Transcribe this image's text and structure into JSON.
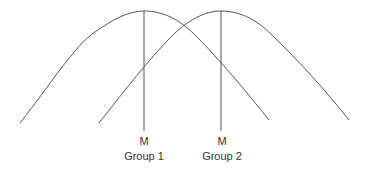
{
  "diagram": {
    "line_color": "#555555",
    "groups": [
      {
        "mean_label": "M",
        "group_label": "Group 1"
      },
      {
        "mean_label": "M",
        "group_label": "Group 2"
      }
    ]
  }
}
